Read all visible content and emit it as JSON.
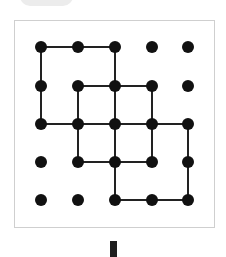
{
  "diagram": {
    "grid": {
      "rows": 5,
      "cols": 5,
      "col_x": [
        41,
        78,
        115,
        152,
        188
      ],
      "row_y": [
        47,
        86,
        124,
        162,
        200
      ],
      "dot_radius": 6,
      "dot_color": "#111111"
    },
    "line_color": "#222222",
    "line_width": 2,
    "squares": [
      {
        "name": "square-top-left",
        "from": [
          0,
          0
        ],
        "to": [
          2,
          2
        ]
      },
      {
        "name": "square-middle",
        "from": [
          1,
          1
        ],
        "to": [
          3,
          3
        ]
      },
      {
        "name": "square-bottom-right",
        "from": [
          2,
          2
        ],
        "to": [
          4,
          4
        ]
      }
    ],
    "frame_border_color": "#cfcfcf"
  }
}
